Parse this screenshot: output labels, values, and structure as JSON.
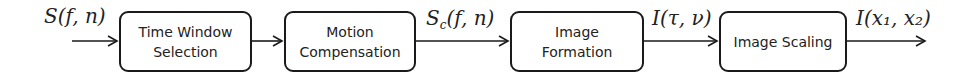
{
  "diagram": {
    "type": "block-diagram",
    "direction": "left-to-right",
    "blocks": [
      {
        "id": "time-window-selection",
        "label": "Time Window\nSelection"
      },
      {
        "id": "motion-compensation",
        "label": "Motion\nCompensation"
      },
      {
        "id": "image-formation",
        "label": "Image\nFormation"
      },
      {
        "id": "image-scaling",
        "label": "Image Scaling"
      }
    ],
    "signals": {
      "input": {
        "main": "S",
        "sub": "",
        "args": "(f, n)"
      },
      "after_motion_compensation": {
        "main": "S",
        "sub": "c",
        "args": "(f, n)"
      },
      "after_image_formation": {
        "main": "I",
        "sub": "",
        "args": "(τ, ν)"
      },
      "output": {
        "main": "I",
        "sub": "",
        "args": "(x₁, x₂)"
      }
    },
    "colors": {
      "stroke": "#1a1a1a",
      "text": "#222222",
      "background": "#ffffff"
    }
  }
}
